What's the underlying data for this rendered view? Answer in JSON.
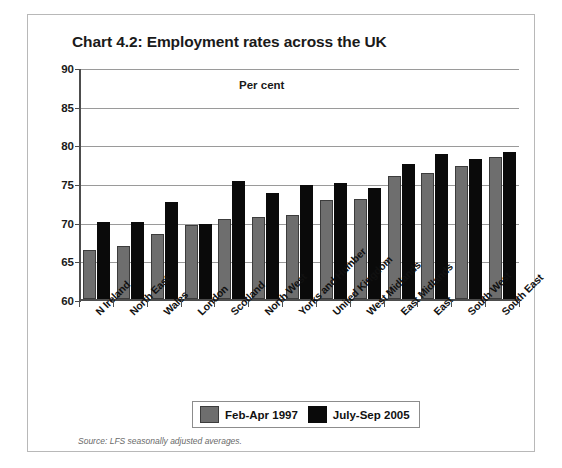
{
  "chart_data": {
    "type": "bar",
    "title": "Chart 4.2: Employment rates across the UK",
    "xlabel": "",
    "ylabel": "Per cent",
    "ylim": [
      60,
      90
    ],
    "yticks": [
      60,
      65,
      70,
      75,
      80,
      85,
      90
    ],
    "grid": true,
    "legend_position": "bottom",
    "categories": [
      "N Ireland",
      "North East",
      "Wales",
      "London",
      "Scotland",
      "North West",
      "Yorks and Humber",
      "United Kingdom",
      "West Midlands",
      "East Midlands",
      "East",
      "South West",
      "South East"
    ],
    "series": [
      {
        "name": "Feb-Apr 1997",
        "color": "#6e6e6e",
        "values": [
          66.4,
          66.9,
          68.4,
          69.6,
          70.4,
          70.6,
          70.9,
          72.8,
          72.9,
          75.9,
          76.3,
          77.2,
          78.4
        ]
      },
      {
        "name": "July-Sep 2005",
        "color": "#0a0a0a",
        "values": [
          70.0,
          70.0,
          72.6,
          69.7,
          75.3,
          73.7,
          74.8,
          75.0,
          74.3,
          77.4,
          78.8,
          78.1,
          79.0
        ]
      }
    ],
    "annotations": {
      "unit_label": "Per cent"
    },
    "source": "Source: LFS seasonally adjusted averages."
  }
}
